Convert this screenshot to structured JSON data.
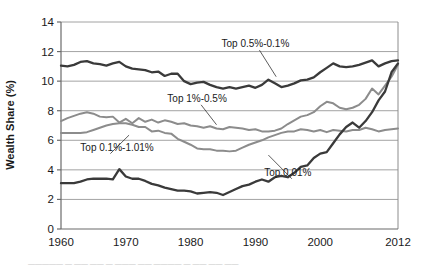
{
  "chart_data": {
    "type": "line",
    "title": "",
    "xlabel": "",
    "ylabel": "Wealth Share (%)",
    "xlim": [
      1960,
      2012
    ],
    "ylim": [
      0,
      14
    ],
    "xticks": [
      1960,
      1970,
      1980,
      1990,
      2000,
      2012
    ],
    "yticks": [
      0,
      2,
      4,
      6,
      8,
      10,
      12,
      14
    ],
    "grid": true,
    "legend_position": "inline-annotations",
    "x": [
      1960,
      1961,
      1962,
      1963,
      1964,
      1965,
      1966,
      1967,
      1968,
      1969,
      1970,
      1971,
      1972,
      1973,
      1974,
      1975,
      1976,
      1977,
      1978,
      1979,
      1980,
      1981,
      1982,
      1983,
      1984,
      1985,
      1986,
      1987,
      1988,
      1989,
      1990,
      1991,
      1992,
      1993,
      1994,
      1995,
      1996,
      1997,
      1998,
      1999,
      2000,
      2001,
      2002,
      2003,
      2004,
      2005,
      2006,
      2007,
      2008,
      2009,
      2010,
      2011,
      2012
    ],
    "series": [
      {
        "name": "Top 0.5%-0.1%",
        "color": "#3a3a3a",
        "width": 2.3,
        "label_x": 1990,
        "label_y": 12.3,
        "values": [
          11.05,
          11.0,
          11.1,
          11.3,
          11.35,
          11.2,
          11.15,
          11.05,
          11.2,
          11.3,
          11.0,
          10.85,
          10.8,
          10.75,
          10.6,
          10.65,
          10.35,
          10.5,
          10.5,
          10.0,
          9.8,
          9.9,
          9.95,
          9.75,
          9.6,
          9.5,
          9.6,
          9.5,
          9.6,
          9.7,
          9.55,
          9.75,
          10.1,
          9.85,
          9.6,
          9.7,
          9.85,
          10.05,
          10.1,
          10.25,
          10.6,
          10.9,
          11.2,
          11.0,
          10.95,
          11.0,
          11.1,
          11.25,
          11.4,
          11.0,
          11.2,
          11.35,
          11.4
        ]
      },
      {
        "name": "Top 1%-0.5%",
        "color": "#8c8c8c",
        "width": 2.0,
        "label_x": 1981,
        "label_y": 8.6,
        "values": [
          7.3,
          7.5,
          7.65,
          7.8,
          7.9,
          7.8,
          7.6,
          7.55,
          7.6,
          7.2,
          7.45,
          7.15,
          7.5,
          7.25,
          7.4,
          7.2,
          7.35,
          7.25,
          7.1,
          7.15,
          7.0,
          6.95,
          6.85,
          6.95,
          6.8,
          6.75,
          6.9,
          6.85,
          6.8,
          6.7,
          6.75,
          6.6,
          6.6,
          6.65,
          6.8,
          7.1,
          7.35,
          7.6,
          7.7,
          7.9,
          8.3,
          8.6,
          8.5,
          8.2,
          8.1,
          8.2,
          8.4,
          8.8,
          9.5,
          9.1,
          9.7,
          10.3,
          11.1
        ]
      },
      {
        "name": "Top 0.1%-1.01%",
        "color": "#8c8c8c",
        "width": 2.0,
        "label_x": 1967,
        "label_y": 5.3,
        "values": [
          6.5,
          6.5,
          6.5,
          6.5,
          6.55,
          6.7,
          6.85,
          7.0,
          7.1,
          7.15,
          7.15,
          7.05,
          6.9,
          6.9,
          6.6,
          6.65,
          6.5,
          6.45,
          6.1,
          5.9,
          5.7,
          5.45,
          5.4,
          5.4,
          5.3,
          5.3,
          5.25,
          5.3,
          5.5,
          5.7,
          5.85,
          6.0,
          6.2,
          6.35,
          6.5,
          6.6,
          6.6,
          6.75,
          6.7,
          6.6,
          6.7,
          6.55,
          6.7,
          6.65,
          6.6,
          6.7,
          6.7,
          6.85,
          6.75,
          6.6,
          6.7,
          6.75,
          6.8
        ]
      },
      {
        "name": "Top 0.01%",
        "color": "#3a3a3a",
        "width": 2.3,
        "label_x": 1995,
        "label_y": 3.6,
        "values": [
          3.1,
          3.1,
          3.1,
          3.2,
          3.35,
          3.4,
          3.4,
          3.4,
          3.35,
          4.05,
          3.55,
          3.4,
          3.4,
          3.25,
          3.05,
          2.95,
          2.8,
          2.7,
          2.6,
          2.6,
          2.55,
          2.4,
          2.45,
          2.5,
          2.45,
          2.3,
          2.5,
          2.7,
          2.9,
          3.0,
          3.2,
          3.35,
          3.2,
          3.5,
          3.6,
          3.5,
          3.8,
          4.2,
          4.3,
          4.8,
          5.1,
          5.2,
          5.8,
          6.4,
          6.9,
          7.2,
          6.85,
          7.3,
          7.9,
          8.7,
          9.3,
          10.6,
          11.2
        ]
      }
    ]
  },
  "axis": {
    "y_label": "Wealth Share (%)",
    "x_tick_labels": [
      "1960",
      "1970",
      "1980",
      "1990",
      "2000",
      "2012"
    ],
    "y_tick_labels": [
      "0",
      "2",
      "4",
      "6",
      "8",
      "10",
      "12",
      "14"
    ]
  },
  "annotations": [
    {
      "text": "Top 0.5%-0.1%",
      "name": "annotation-top-0-5-to-0-1"
    },
    {
      "text": "Top 1%-0.5%",
      "name": "annotation-top-1-to-0-5"
    },
    {
      "text": "Top 0.1%-1.01%",
      "name": "annotation-top-0-1-to-1-01"
    },
    {
      "text": "Top 0.01%",
      "name": "annotation-top-0-01"
    }
  ],
  "caption": {
    "text": "—————  —  ——   ——   — ———  —— ———— — —— —— ——"
  }
}
